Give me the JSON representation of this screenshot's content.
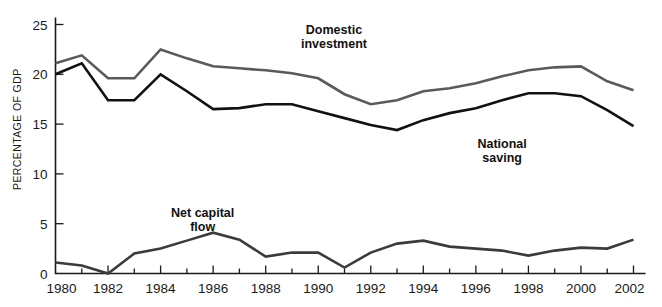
{
  "chart_data": {
    "type": "line",
    "title": "",
    "xlabel": "",
    "ylabel": "PERCENTAGE OF GDP",
    "xlim": [
      1980,
      2002
    ],
    "ylim": [
      0,
      26
    ],
    "grid": false,
    "legend_position": "inline-annotations",
    "x": [
      1980,
      1981,
      1982,
      1983,
      1984,
      1985,
      1986,
      1987,
      1988,
      1989,
      1990,
      1991,
      1992,
      1993,
      1994,
      1995,
      1996,
      1997,
      1998,
      1999,
      2000,
      2001,
      2002
    ],
    "xticks": [
      1980,
      1982,
      1984,
      1986,
      1988,
      1990,
      1992,
      1994,
      1996,
      1998,
      2000,
      2002
    ],
    "xtick_labels": [
      "1980",
      "1982",
      "1984",
      "1986",
      "1988",
      "1990",
      "1992",
      "1994",
      "1996",
      "1998",
      "2000",
      "2002"
    ],
    "yticks": [
      0,
      5,
      10,
      15,
      20,
      25
    ],
    "ytick_labels": [
      "0",
      "5",
      "10",
      "15",
      "20",
      "25"
    ],
    "series": [
      {
        "name": "Domestic investment",
        "color": "#5a5a5a",
        "line_width": 2.6,
        "label_x": 1990.6,
        "label_y": 24.0,
        "values": [
          21.1,
          21.9,
          19.6,
          19.6,
          22.5,
          21.6,
          20.8,
          20.6,
          20.4,
          20.1,
          19.6,
          18.0,
          17.0,
          17.4,
          18.3,
          18.6,
          19.1,
          19.8,
          20.4,
          20.7,
          20.8,
          19.3,
          18.4
        ]
      },
      {
        "name": "National saving",
        "color": "#111111",
        "line_width": 2.6,
        "label_x": 1997.0,
        "label_y": 12.6,
        "values": [
          20.0,
          21.1,
          17.4,
          17.4,
          20.0,
          18.3,
          16.5,
          16.6,
          17.0,
          17.0,
          16.3,
          15.6,
          14.9,
          14.4,
          15.4,
          16.1,
          16.6,
          17.4,
          18.1,
          18.1,
          17.8,
          16.4,
          14.8
        ]
      },
      {
        "name": "Net capital flow",
        "color": "#3b3b3b",
        "line_width": 2.6,
        "label_x": 1985.6,
        "label_y": 5.7,
        "values": [
          1.1,
          0.8,
          0.0,
          2.0,
          2.5,
          3.3,
          4.1,
          3.4,
          1.7,
          2.1,
          2.1,
          0.6,
          2.1,
          3.0,
          3.3,
          2.7,
          2.5,
          2.3,
          1.8,
          2.3,
          2.6,
          2.5,
          3.4
        ]
      }
    ],
    "annotations": [
      {
        "text_line1": "Domestic",
        "text_line2": "investment"
      },
      {
        "text_line1": "National",
        "text_line2": "saving"
      },
      {
        "text_line1": "Net capital",
        "text_line2": "flow"
      }
    ]
  }
}
